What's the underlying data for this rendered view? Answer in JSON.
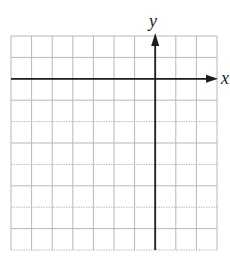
{
  "diagram": {
    "type": "coordinate-grid",
    "axes": {
      "x_label": "x",
      "y_label": "y"
    },
    "grid": {
      "columns": 10,
      "rows": 10,
      "left": 11,
      "top": 36,
      "right": 217,
      "bottom": 250,
      "y_axis_column_index": 7,
      "x_axis_row_index": 2,
      "line_color": "#b8b8b8",
      "axis_color": "#1e1e1e"
    }
  }
}
